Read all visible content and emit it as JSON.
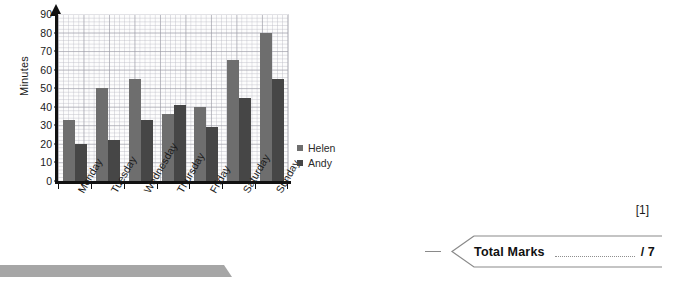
{
  "chart_data": {
    "type": "bar",
    "title": "",
    "xlabel": "",
    "ylabel": "Minutes",
    "ylim": [
      0,
      90
    ],
    "yticks": [
      90,
      80,
      70,
      60,
      50,
      40,
      30,
      20,
      10,
      0
    ],
    "grid": true,
    "legend_position": "right",
    "categories": [
      "Monday",
      "Tuesday",
      "Wednesday",
      "Thursday",
      "Friday",
      "Saturday",
      "Sunday"
    ],
    "series": [
      {
        "name": "Helen",
        "color": "#6e6e6e",
        "values": [
          33,
          50,
          55,
          36,
          40,
          65,
          80
        ]
      },
      {
        "name": "Andy",
        "color": "#464646",
        "values": [
          20,
          22,
          33,
          41,
          29,
          45,
          55
        ]
      }
    ]
  },
  "legend": {
    "items": [
      {
        "label": "Helen",
        "color": "#6e6e6e"
      },
      {
        "label": "Andy",
        "color": "#464646"
      }
    ]
  },
  "marks": {
    "question_mark": "[1]",
    "total_label": "Total Marks",
    "total_denominator": "/ 7"
  },
  "colors": {
    "axis": "#111111",
    "grid_major": "#9696a0",
    "grid_minor": "#b9b9c3",
    "banner": "#a6a6a6",
    "box_border": "#8a8a8a"
  }
}
